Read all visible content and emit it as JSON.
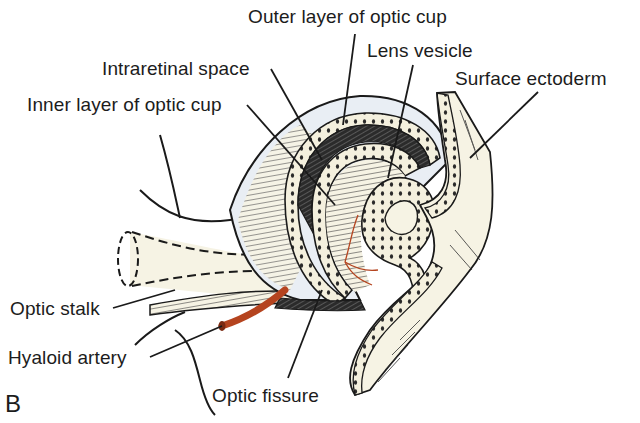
{
  "figure": {
    "panel_letter": "B",
    "labels": {
      "outer_layer": "Outer layer of optic cup",
      "intraretinal_space": "Intraretinal space",
      "lens_vesicle": "Lens vesicle",
      "inner_layer": "Inner layer of optic cup",
      "surface_ectoderm": "Surface ectoderm",
      "optic_stalk": "Optic stalk",
      "hyaloid_artery": "Hyaloid artery",
      "optic_fissure": "Optic fissure"
    },
    "colors": {
      "tissue_fill": "#f6f3e4",
      "cup_fill": "#e9eef4",
      "line": "#1a1a1a",
      "artery": "#b5441f",
      "background": "#ffffff"
    }
  }
}
